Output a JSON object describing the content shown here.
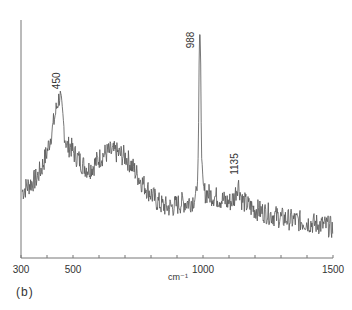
{
  "chart_data": {
    "type": "line",
    "title": "",
    "panel_label": "(b)",
    "xlabel": "cm-1",
    "xlabel_display": "cm⁻¹",
    "ylabel": "",
    "xlim": [
      300,
      1500
    ],
    "ylim": [
      0,
      100
    ],
    "grid": false,
    "x_tick_labels": [
      {
        "value": 300,
        "label": "300"
      },
      {
        "value": 500,
        "label": "500"
      },
      {
        "value": 1000,
        "label": "1000"
      },
      {
        "value": 1500,
        "label": "1500"
      }
    ],
    "x_minor_ticks": [
      400,
      600,
      700,
      800,
      900,
      1100,
      1200,
      1300,
      1400
    ],
    "peak_labels": [
      {
        "x": 450,
        "label": "450",
        "y": 66
      },
      {
        "x": 988,
        "label": "988",
        "y": 100
      },
      {
        "x": 1135,
        "label": "1135",
        "y": 30
      }
    ],
    "series": [
      {
        "name": "spectrum",
        "color": "#555555",
        "envelope_points": [
          [
            305,
            22
          ],
          [
            320,
            24
          ],
          [
            340,
            26
          ],
          [
            360,
            28
          ],
          [
            380,
            33
          ],
          [
            400,
            40
          ],
          [
            420,
            50
          ],
          [
            440,
            62
          ],
          [
            450,
            66
          ],
          [
            460,
            56
          ],
          [
            470,
            46
          ],
          [
            480,
            42
          ],
          [
            490,
            43
          ],
          [
            500,
            40
          ],
          [
            520,
            37
          ],
          [
            540,
            34
          ],
          [
            560,
            32
          ],
          [
            580,
            34
          ],
          [
            600,
            37
          ],
          [
            620,
            39
          ],
          [
            640,
            40
          ],
          [
            660,
            40
          ],
          [
            680,
            39
          ],
          [
            700,
            38
          ],
          [
            720,
            35
          ],
          [
            740,
            31
          ],
          [
            760,
            27
          ],
          [
            780,
            24
          ],
          [
            800,
            21
          ],
          [
            820,
            18
          ],
          [
            840,
            16
          ],
          [
            860,
            15
          ],
          [
            880,
            15
          ],
          [
            900,
            16
          ],
          [
            920,
            17
          ],
          [
            940,
            17
          ],
          [
            960,
            18
          ],
          [
            975,
            20
          ],
          [
            982,
            40
          ],
          [
            985,
            80
          ],
          [
            988,
            100
          ],
          [
            991,
            80
          ],
          [
            994,
            40
          ],
          [
            1000,
            22
          ],
          [
            1020,
            21
          ],
          [
            1040,
            20
          ],
          [
            1060,
            19
          ],
          [
            1080,
            18
          ],
          [
            1100,
            17
          ],
          [
            1120,
            19
          ],
          [
            1135,
            26
          ],
          [
            1150,
            18
          ],
          [
            1180,
            15
          ],
          [
            1200,
            14
          ],
          [
            1250,
            12
          ],
          [
            1300,
            10
          ],
          [
            1350,
            9
          ],
          [
            1400,
            8
          ],
          [
            1450,
            7
          ],
          [
            1490,
            6
          ],
          [
            1500,
            5
          ]
        ],
        "noise_amplitude": 5
      }
    ]
  }
}
